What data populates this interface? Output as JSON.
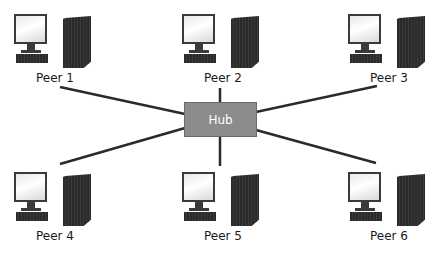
{
  "diagram": {
    "type": "hub network topology",
    "hub": {
      "label": "Hub",
      "color": "#8c8c8c"
    },
    "peers": [
      {
        "label": "Peer 1",
        "x": 12,
        "y": 14
      },
      {
        "label": "Peer 2",
        "x": 180,
        "y": 14
      },
      {
        "label": "Peer 3",
        "x": 346,
        "y": 14
      },
      {
        "label": "Peer 4",
        "x": 12,
        "y": 172
      },
      {
        "label": "Peer 5",
        "x": 180,
        "y": 172
      },
      {
        "label": "Peer 6",
        "x": 346,
        "y": 172
      }
    ],
    "line_color": "#2a2a2a"
  }
}
